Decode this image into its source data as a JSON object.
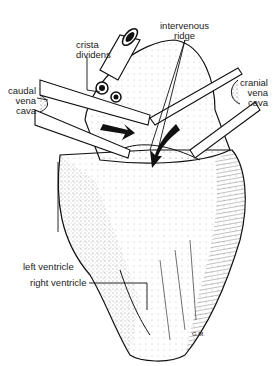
{
  "figure": {
    "labels": {
      "intervenous_ridge": [
        "intervenous",
        "ridge"
      ],
      "crista_dividens": [
        "crista",
        "dividens"
      ],
      "caudal_vena_cava": [
        "caudal",
        "vena",
        "cava"
      ],
      "cranial_vena_cava": [
        "cranial",
        "vena",
        "cava"
      ],
      "left_ventricle": "left ventricle",
      "right_ventricle": "right ventricle"
    },
    "signature": "G.M.",
    "colors": {
      "ink": "#111111",
      "paper": "#ffffff",
      "label": "#222222"
    }
  }
}
